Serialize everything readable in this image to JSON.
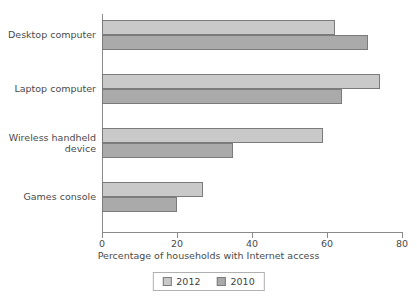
{
  "chart_data": {
    "type": "bar",
    "orientation": "horizontal",
    "title": "",
    "subtitle": "",
    "xlabel": "Percentage of households with Internet access",
    "ylabel": "",
    "categories": [
      "Desktop computer",
      "Laptop computer",
      "Wireless handheld device",
      "Games console"
    ],
    "series": [
      {
        "name": "2012",
        "color": "#c9c9c9",
        "values": [
          62,
          74,
          59,
          27
        ]
      },
      {
        "name": "2010",
        "color": "#aaaaaa",
        "values": [
          71,
          64,
          35,
          20
        ]
      }
    ],
    "xlim": [
      0,
      80
    ],
    "xticks": [
      0,
      20,
      40,
      60,
      80
    ],
    "xtick_labels": [
      "0",
      "20",
      "40",
      "60",
      "80"
    ],
    "grid": false,
    "legend_position": "bottom"
  },
  "legend": {
    "items": [
      {
        "label": "2012",
        "color": "#c9c9c9"
      },
      {
        "label": "2010",
        "color": "#aaaaaa"
      }
    ]
  },
  "axis": {
    "x_title": "Percentage of households with Internet access"
  },
  "colors": {
    "series_2012": "#c9c9c9",
    "series_2010": "#aaaaaa",
    "bar_border": "#7b7b7b",
    "axis_line": "#8a8a8a",
    "text": "#4a4a4a",
    "background": "#ffffff"
  }
}
